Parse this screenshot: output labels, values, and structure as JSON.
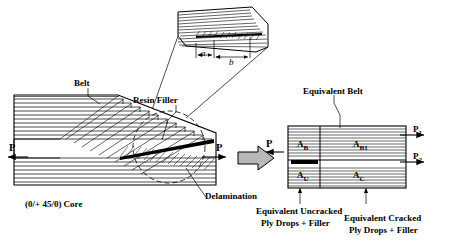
{
  "figure": {
    "title": "",
    "labels": {
      "belt": "Belt",
      "resin_filler": "Resin Filler",
      "delamination": "Delamination",
      "core": "(0/+ 45/0) Core",
      "equivalent_belt": "Equivalent Belt",
      "equiv_uncracked": "Equivalent Uncracked",
      "equiv_uncracked_2": "Ply Drops + Filler",
      "equiv_cracked": "Equivalent Cracked",
      "equiv_cracked_2": "Ply Drops + Filler"
    },
    "loads": {
      "left_p": "P",
      "right_p": "P",
      "right2_p": "P",
      "p1": "P",
      "p1_sub": "1",
      "p2": "P",
      "p2_sub": "2"
    },
    "regions": {
      "a_b": "A",
      "a_b_sub": "B",
      "a_b1": "A",
      "a_b1_sub": "B1",
      "a_u": "A",
      "a_u_sub": "U",
      "a_c": "A",
      "a_c_sub": "C"
    },
    "detail": {
      "a": "a",
      "b": "b"
    }
  }
}
